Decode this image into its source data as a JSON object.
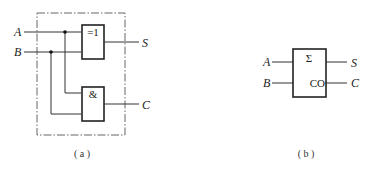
{
  "figure_a": {
    "caption": "( a )",
    "inputs": {
      "a": "A",
      "b": "B"
    },
    "outputs": {
      "s": "S",
      "c": "C"
    },
    "xor_gate": {
      "label": "=1"
    },
    "and_gate": {
      "label": "&"
    }
  },
  "figure_b": {
    "caption": "( b )",
    "inputs": {
      "a": "A",
      "b": "B"
    },
    "outputs": {
      "s": "S",
      "c": "C"
    },
    "block": {
      "sum_label": "Σ",
      "carry_label": "CO"
    }
  }
}
